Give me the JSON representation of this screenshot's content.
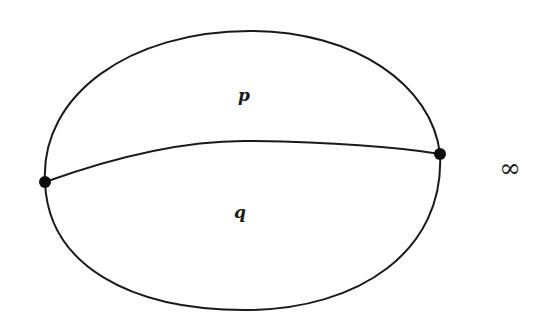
{
  "diagram": {
    "type": "planar graph (theta graph) with two vertices and three edges",
    "vertices": [
      {
        "id": "left",
        "x": 45,
        "y": 182
      },
      {
        "id": "right",
        "x": 440,
        "y": 154
      }
    ],
    "edges": [
      {
        "id": "upper-arc",
        "from": "left",
        "to": "right",
        "path": "M45,182 C40,95 130,31 250,31 C355,31 432,85 440,154"
      },
      {
        "id": "middle-arc",
        "from": "left",
        "to": "right",
        "path": "M45,182 C120,155 190,140 250,141 C320,142 390,146 440,154"
      },
      {
        "id": "lower-arc",
        "from": "left",
        "to": "right",
        "path": "M45,182 C48,265 130,310 245,310 C360,310 445,250 440,154"
      }
    ],
    "labels": {
      "face_upper": "p",
      "face_lower": "q",
      "outer_face": "∞"
    },
    "label_positions": {
      "face_upper": {
        "x": 244,
        "y": 101
      },
      "face_lower": {
        "x": 240,
        "y": 218
      },
      "outer_face": {
        "x": 510,
        "y": 177
      }
    },
    "colors": {
      "stroke": "#1a1a1a",
      "vertex": "#0d0d0d",
      "background": "#ffffff"
    }
  }
}
